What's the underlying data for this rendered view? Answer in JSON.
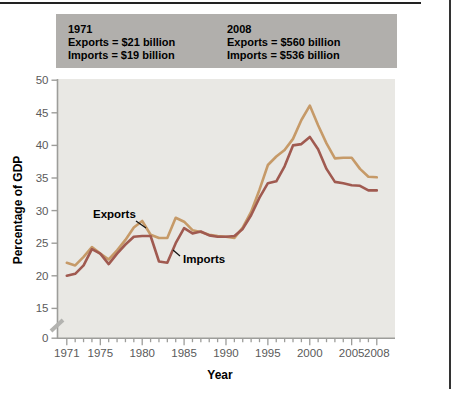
{
  "page": {
    "top_rule_color": "#222222",
    "right_rule_color": "#333333"
  },
  "summary": {
    "background": "#b1afac",
    "col1": {
      "year": "1971",
      "exports": "Exports = $21 billion",
      "imports": "Imports = $19 billion"
    },
    "col2": {
      "year": "2008",
      "exports": "Exports = $560 billion",
      "imports": "Imports = $536 billion"
    }
  },
  "chart_data": {
    "type": "line",
    "title": "",
    "xlabel": "Year",
    "ylabel": "Percentage of GDP",
    "xlim": [
      1971,
      2008
    ],
    "ylim": [
      0,
      50
    ],
    "y_axis_break_between": [
      0,
      15
    ],
    "grid": false,
    "legend_position": "inline-annotations",
    "plot_background": "#e9e8e4",
    "axis_color": "#9d9d9a",
    "tick_label_color": "#5a5a5a",
    "x_tick_labels": [
      1971,
      1975,
      1980,
      1985,
      1990,
      1995,
      2000,
      2005,
      2008
    ],
    "y_tick_labels": [
      0,
      15,
      20,
      25,
      30,
      35,
      40,
      45,
      50
    ],
    "x": [
      1971,
      1972,
      1973,
      1974,
      1975,
      1976,
      1977,
      1978,
      1979,
      1980,
      1981,
      1982,
      1983,
      1984,
      1985,
      1986,
      1987,
      1988,
      1989,
      1990,
      1991,
      1992,
      1993,
      1994,
      1995,
      1996,
      1997,
      1998,
      1999,
      2000,
      2001,
      2002,
      2003,
      2004,
      2005,
      2006,
      2007,
      2008
    ],
    "series": [
      {
        "name": "Exports",
        "color": "#c69a68",
        "values": [
          22.0,
          21.6,
          22.9,
          24.4,
          23.4,
          22.5,
          23.9,
          25.5,
          27.4,
          28.4,
          26.3,
          25.8,
          25.8,
          28.9,
          28.3,
          27.0,
          26.7,
          26.3,
          26.1,
          26.0,
          25.8,
          27.4,
          29.8,
          33.2,
          37.0,
          38.3,
          39.3,
          41.0,
          43.9,
          46.1,
          43.1,
          40.3,
          38.0,
          38.1,
          38.1,
          36.4,
          35.2,
          35.1
        ]
      },
      {
        "name": "Imports",
        "color": "#a05a50",
        "values": [
          20.0,
          20.3,
          21.6,
          24.1,
          23.4,
          21.8,
          23.4,
          24.8,
          26.0,
          26.1,
          26.1,
          22.2,
          22.0,
          25.0,
          27.3,
          26.5,
          26.8,
          26.2,
          26.0,
          26.0,
          26.1,
          27.2,
          29.3,
          32.0,
          34.2,
          34.5,
          36.8,
          40.0,
          40.2,
          41.3,
          39.4,
          36.4,
          34.4,
          34.2,
          33.9,
          33.8,
          33.1,
          33.1
        ]
      }
    ],
    "annotations": [
      {
        "text": "Exports",
        "text_x": 93,
        "text_y": 218,
        "pointer": [
          [
            136,
            221
          ],
          [
            146,
            228
          ]
        ]
      },
      {
        "text": "Imports",
        "text_x": 183,
        "text_y": 263,
        "pointer": [
          [
            180,
            256
          ],
          [
            173,
            250
          ]
        ]
      }
    ]
  }
}
